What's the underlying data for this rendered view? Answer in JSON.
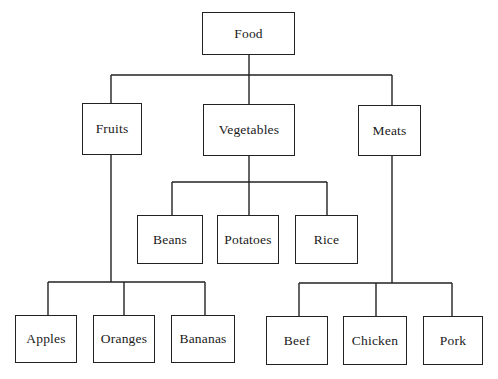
{
  "diagram": {
    "type": "tree",
    "root": {
      "label": "Food",
      "children": [
        {
          "label": "Fruits",
          "children": [
            {
              "label": "Apples"
            },
            {
              "label": "Oranges"
            },
            {
              "label": "Bananas"
            }
          ]
        },
        {
          "label": "Vegetables",
          "children": [
            {
              "label": "Beans"
            },
            {
              "label": "Potatoes"
            },
            {
              "label": "Rice"
            }
          ]
        },
        {
          "label": "Meats",
          "children": [
            {
              "label": "Beef"
            },
            {
              "label": "Chicken"
            },
            {
              "label": "Pork"
            }
          ]
        }
      ]
    }
  },
  "nodes": {
    "food": "Food",
    "fruits": "Fruits",
    "vegetables": "Vegetables",
    "meats": "Meats",
    "beans": "Beans",
    "potatoes": "Potatoes",
    "rice": "Rice",
    "apples": "Apples",
    "oranges": "Oranges",
    "bananas": "Bananas",
    "beef": "Beef",
    "chicken": "Chicken",
    "pork": "Pork"
  },
  "colors": {
    "line": "#222222",
    "background": "#ffffff"
  }
}
